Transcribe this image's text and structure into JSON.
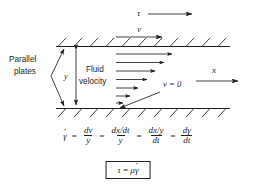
{
  "diagram": {
    "labels": {
      "parallel_plates_line1": "Parallel",
      "parallel_plates_line2": "plates",
      "gap_height": "y",
      "fluid_velocity_line1": "Fluid",
      "fluid_velocity_line2": "velocity",
      "shear_stress": "τ",
      "plate_velocity": "v",
      "zero_velocity": "v = 0",
      "x_axis": "x"
    },
    "colors": {
      "ink": "#231f20",
      "background": "#ffffff"
    },
    "velocity_profile": {
      "description": "Linear velocity profile arrows, longest at the moving top plate, zero at the stationary bottom plate",
      "arrow_lengths_px": [
        63,
        52,
        41,
        31,
        21,
        12,
        6
      ]
    }
  },
  "equations": {
    "shear_rate": {
      "lhs": "γ̇",
      "terms": [
        {
          "num": "dv",
          "den": "y"
        },
        {
          "num": "dx/dt",
          "den": "y"
        },
        {
          "num": "dx/y",
          "den": "dt"
        },
        {
          "num": "dγ",
          "den": "dt"
        }
      ],
      "operator": "="
    },
    "boxed": {
      "lhs": "τ",
      "operator": "=",
      "rhs_mu": "μ",
      "rhs_gamma": "γ̇",
      "full": "τ = μγ̇"
    }
  }
}
